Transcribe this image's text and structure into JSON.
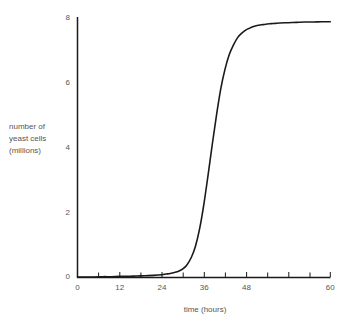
{
  "chart_data": {
    "type": "line",
    "title": "",
    "subtitle": "",
    "xlabel": "time (hours)",
    "ylabel": "number of\nyeast cells\n(millions)",
    "ylabel_lines": [
      "number of",
      "yeast cells",
      "(millions)"
    ],
    "xlim": [
      0,
      60
    ],
    "ylim": [
      0,
      8
    ],
    "xticks": [
      0,
      12,
      24,
      36,
      48,
      60
    ],
    "xtick_labels": [
      "0",
      "12",
      "24",
      "36",
      "48",
      "60"
    ],
    "xticks_minor": [
      6,
      18,
      30,
      42,
      54
    ],
    "yticks": [
      0,
      2,
      4,
      6,
      8
    ],
    "ytick_labels": [
      "0",
      "2",
      "4",
      "6",
      "8"
    ],
    "grid": false,
    "legend": false,
    "legend_position": "none",
    "annotations": [],
    "series": [
      {
        "name": "yeast cell count",
        "style": "solid",
        "color": "#1a1a1a",
        "linewidth": 1.6,
        "x": [
          0,
          2,
          4,
          6,
          8,
          10,
          12,
          14,
          16,
          18,
          20,
          21,
          22,
          23,
          24,
          25,
          26,
          27,
          28,
          29,
          30,
          31,
          32,
          33,
          34,
          35,
          36,
          37,
          38,
          39,
          40,
          41,
          42,
          43,
          44,
          45,
          46,
          47,
          48,
          50,
          52,
          54,
          56,
          58,
          60
        ],
        "values": [
          0.0,
          0.0,
          0.0,
          0.01,
          0.01,
          0.02,
          0.02,
          0.03,
          0.04,
          0.05,
          0.07,
          0.09,
          0.11,
          0.14,
          0.18,
          0.25,
          0.38,
          0.6,
          0.95,
          1.5,
          2.25,
          3.15,
          4.1,
          5.0,
          5.8,
          6.4,
          6.85,
          7.15,
          7.38,
          7.52,
          7.62,
          7.68,
          7.73,
          7.76,
          7.78,
          7.8,
          7.81,
          7.82,
          7.83,
          7.84,
          7.85,
          7.86,
          7.86,
          7.87,
          7.87
        ]
      }
    ]
  },
  "axes": {
    "x_axis_name": "time axis",
    "y_axis_name": "cell count axis"
  },
  "colors": {
    "background": "#ffffff",
    "axis": "#1a1a1a",
    "curve": "#1a1a1a",
    "text": "#565656"
  }
}
